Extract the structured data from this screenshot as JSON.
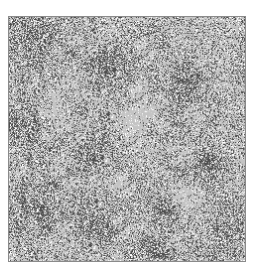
{
  "image": {
    "description": "Grayscale speckled texture (classified/thresholded image) inside a thin gray border",
    "frame": {
      "x": 8,
      "y": 16,
      "width": 238,
      "height": 246,
      "border_color": "#8a8a8a"
    },
    "palette": {
      "base": "#c4c4c4",
      "light": "#d6d6d6",
      "mid": "#8c8c8c",
      "dark": "#4e4e4e",
      "white": "#ffffff"
    },
    "dark_clusters": [
      {
        "cx": 0.1,
        "cy": 0.1,
        "r": 0.14
      },
      {
        "cx": 0.42,
        "cy": 0.22,
        "r": 0.13
      },
      {
        "cx": 0.75,
        "cy": 0.28,
        "r": 0.12
      },
      {
        "cx": 0.05,
        "cy": 0.45,
        "r": 0.12
      },
      {
        "cx": 0.35,
        "cy": 0.55,
        "r": 0.1
      },
      {
        "cx": 0.85,
        "cy": 0.6,
        "r": 0.12
      },
      {
        "cx": 0.1,
        "cy": 0.78,
        "r": 0.15
      },
      {
        "cx": 0.35,
        "cy": 0.85,
        "r": 0.12
      },
      {
        "cx": 0.65,
        "cy": 0.78,
        "r": 0.1
      },
      {
        "cx": 0.62,
        "cy": 0.95,
        "r": 0.1
      },
      {
        "cx": 0.92,
        "cy": 0.9,
        "r": 0.1
      }
    ],
    "light_patches": [
      {
        "cx": 0.2,
        "cy": 0.35,
        "r": 0.1
      },
      {
        "cx": 0.55,
        "cy": 0.4,
        "r": 0.14
      },
      {
        "cx": 0.75,
        "cy": 0.75,
        "r": 0.1
      },
      {
        "cx": 0.45,
        "cy": 0.7,
        "r": 0.08
      }
    ]
  }
}
